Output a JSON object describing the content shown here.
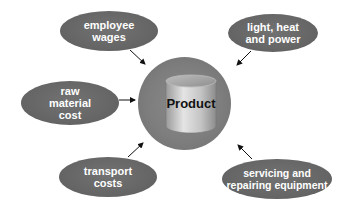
{
  "diagram": {
    "center": {
      "label": "Product",
      "icon": "cylinder-icon"
    },
    "inputs": [
      {
        "id": "employee-wages",
        "label": "employee\nwages"
      },
      {
        "id": "light-heat-power",
        "label": "light, heat\nand power"
      },
      {
        "id": "raw-material-cost",
        "label": "raw\nmaterial\ncost"
      },
      {
        "id": "transport-costs",
        "label": "transport\ncosts"
      },
      {
        "id": "servicing-repairing-equipment",
        "label": "servicing and\nrepairing equipment"
      }
    ],
    "colors": {
      "oval": "#666666",
      "hub": "#808080",
      "text_light": "#ffffff",
      "text_dark": "#111111",
      "arrow": "#111111"
    }
  }
}
